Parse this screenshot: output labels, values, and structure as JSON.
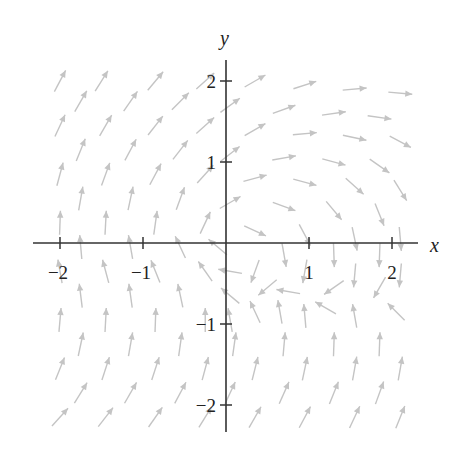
{
  "chart_data": {
    "type": "vector_field",
    "title": "",
    "xlabel": "x",
    "ylabel": "y",
    "xlim": [
      -2.2,
      2.2
    ],
    "ylim": [
      -2.3,
      2.3
    ],
    "xticks": [
      -2,
      -1,
      1,
      2
    ],
    "yticks": [
      -2,
      -1,
      1,
      2
    ],
    "xtick_labels": [
      "−2",
      "−1",
      "1",
      "2"
    ],
    "ytick_labels": [
      "−2",
      "−1",
      "1",
      "2"
    ],
    "grid": false,
    "arrow_color": "#c4c4c4",
    "axis_color": "#333333",
    "arrows": [
      {
        "x": -2.0,
        "y": 2.0,
        "angle": 62
      },
      {
        "x": -1.5,
        "y": 2.0,
        "angle": 58
      },
      {
        "x": -0.85,
        "y": 2.0,
        "angle": 50
      },
      {
        "x": -0.25,
        "y": 2.0,
        "angle": 42
      },
      {
        "x": 0.35,
        "y": 2.0,
        "angle": 30
      },
      {
        "x": 0.95,
        "y": 1.95,
        "angle": 18
      },
      {
        "x": 1.55,
        "y": 1.9,
        "angle": 5
      },
      {
        "x": 2.1,
        "y": 1.85,
        "angle": -5
      },
      {
        "x": -1.75,
        "y": 1.75,
        "angle": 60
      },
      {
        "x": -1.15,
        "y": 1.75,
        "angle": 55
      },
      {
        "x": -0.55,
        "y": 1.75,
        "angle": 45
      },
      {
        "x": 0.05,
        "y": 1.7,
        "angle": 36
      },
      {
        "x": 0.7,
        "y": 1.65,
        "angle": 20
      },
      {
        "x": 1.3,
        "y": 1.6,
        "angle": 8
      },
      {
        "x": 1.85,
        "y": 1.55,
        "angle": -8
      },
      {
        "x": -2.0,
        "y": 1.45,
        "angle": 65
      },
      {
        "x": -1.45,
        "y": 1.45,
        "angle": 60
      },
      {
        "x": -0.85,
        "y": 1.45,
        "angle": 52
      },
      {
        "x": -0.25,
        "y": 1.45,
        "angle": 42
      },
      {
        "x": 0.35,
        "y": 1.4,
        "angle": 30
      },
      {
        "x": 0.95,
        "y": 1.35,
        "angle": 5
      },
      {
        "x": 1.55,
        "y": 1.3,
        "angle": -12
      },
      {
        "x": 2.1,
        "y": 1.25,
        "angle": -28
      },
      {
        "x": -1.75,
        "y": 1.15,
        "angle": 68
      },
      {
        "x": -1.15,
        "y": 1.15,
        "angle": 62
      },
      {
        "x": -0.55,
        "y": 1.15,
        "angle": 52
      },
      {
        "x": 0.05,
        "y": 1.1,
        "angle": 38
      },
      {
        "x": 0.7,
        "y": 1.05,
        "angle": 10
      },
      {
        "x": 1.3,
        "y": 1.0,
        "angle": -15
      },
      {
        "x": 1.85,
        "y": 0.95,
        "angle": -35
      },
      {
        "x": -2.0,
        "y": 0.85,
        "angle": 75
      },
      {
        "x": -1.45,
        "y": 0.85,
        "angle": 70
      },
      {
        "x": -0.85,
        "y": 0.85,
        "angle": 62
      },
      {
        "x": -0.25,
        "y": 0.85,
        "angle": 48
      },
      {
        "x": 0.35,
        "y": 0.8,
        "angle": 15
      },
      {
        "x": 0.95,
        "y": 0.75,
        "angle": -15
      },
      {
        "x": 1.55,
        "y": 0.7,
        "angle": -42
      },
      {
        "x": 2.1,
        "y": 0.65,
        "angle": -58
      },
      {
        "x": -1.75,
        "y": 0.55,
        "angle": 80
      },
      {
        "x": -1.15,
        "y": 0.55,
        "angle": 78
      },
      {
        "x": -0.55,
        "y": 0.55,
        "angle": 70
      },
      {
        "x": 0.05,
        "y": 0.5,
        "angle": 30
      },
      {
        "x": 0.7,
        "y": 0.45,
        "angle": -20
      },
      {
        "x": 1.3,
        "y": 0.4,
        "angle": -50
      },
      {
        "x": 1.85,
        "y": 0.35,
        "angle": -68
      },
      {
        "x": -2.0,
        "y": 0.25,
        "angle": 88
      },
      {
        "x": -1.45,
        "y": 0.25,
        "angle": 87
      },
      {
        "x": -0.85,
        "y": 0.25,
        "angle": 82
      },
      {
        "x": -0.25,
        "y": 0.25,
        "angle": 65
      },
      {
        "x": 0.35,
        "y": 0.15,
        "angle": -25
      },
      {
        "x": 0.95,
        "y": 0.1,
        "angle": -62
      },
      {
        "x": 1.55,
        "y": 0.05,
        "angle": -78
      },
      {
        "x": 2.1,
        "y": 0.05,
        "angle": -85
      },
      {
        "x": -1.75,
        "y": -0.05,
        "angle": 95
      },
      {
        "x": -1.15,
        "y": -0.05,
        "angle": 100
      },
      {
        "x": -0.55,
        "y": -0.05,
        "angle": 115
      },
      {
        "x": -0.1,
        "y": -0.05,
        "angle": 140
      },
      {
        "x": 0.7,
        "y": -0.15,
        "angle": -80
      },
      {
        "x": 1.3,
        "y": -0.15,
        "angle": -88
      },
      {
        "x": 1.85,
        "y": -0.15,
        "angle": -92
      },
      {
        "x": -2.0,
        "y": -0.35,
        "angle": 100
      },
      {
        "x": -1.45,
        "y": -0.35,
        "angle": 105
      },
      {
        "x": -0.85,
        "y": -0.35,
        "angle": 112
      },
      {
        "x": -0.25,
        "y": -0.35,
        "angle": 125
      },
      {
        "x": 0.05,
        "y": -0.35,
        "angle": 170
      },
      {
        "x": 0.35,
        "y": -0.35,
        "angle": -110
      },
      {
        "x": 0.95,
        "y": -0.35,
        "angle": -100
      },
      {
        "x": 1.55,
        "y": -0.4,
        "angle": -95
      },
      {
        "x": 2.1,
        "y": -0.4,
        "angle": -95
      },
      {
        "x": -1.75,
        "y": -0.65,
        "angle": 97
      },
      {
        "x": -1.15,
        "y": -0.65,
        "angle": 98
      },
      {
        "x": -0.55,
        "y": -0.65,
        "angle": 102
      },
      {
        "x": 0.05,
        "y": -0.65,
        "angle": 140
      },
      {
        "x": 0.5,
        "y": -0.55,
        "angle": -140
      },
      {
        "x": 0.75,
        "y": -0.6,
        "angle": 170
      },
      {
        "x": 1.3,
        "y": -0.55,
        "angle": -145
      },
      {
        "x": 1.85,
        "y": -0.55,
        "angle": -120
      },
      {
        "x": -2.0,
        "y": -0.95,
        "angle": 85
      },
      {
        "x": -1.45,
        "y": -0.95,
        "angle": 87
      },
      {
        "x": -0.85,
        "y": -0.95,
        "angle": 88
      },
      {
        "x": -0.25,
        "y": -0.95,
        "angle": 90
      },
      {
        "x": 0.05,
        "y": -0.95,
        "angle": 100
      },
      {
        "x": 0.35,
        "y": -0.85,
        "angle": 115
      },
      {
        "x": 0.65,
        "y": -0.85,
        "angle": 100
      },
      {
        "x": 0.95,
        "y": -0.9,
        "angle": 95
      },
      {
        "x": 1.2,
        "y": -0.8,
        "angle": 150
      },
      {
        "x": 1.55,
        "y": -0.9,
        "angle": 100
      },
      {
        "x": 2.05,
        "y": -0.85,
        "angle": 135
      },
      {
        "x": -1.75,
        "y": -1.25,
        "angle": 78
      },
      {
        "x": -1.15,
        "y": -1.25,
        "angle": 80
      },
      {
        "x": -0.55,
        "y": -1.25,
        "angle": 82
      },
      {
        "x": 0.1,
        "y": -1.25,
        "angle": 82
      },
      {
        "x": 0.7,
        "y": -1.25,
        "angle": 85
      },
      {
        "x": 1.3,
        "y": -1.25,
        "angle": 88
      },
      {
        "x": 1.85,
        "y": -1.25,
        "angle": 88
      },
      {
        "x": -2.0,
        "y": -1.55,
        "angle": 68
      },
      {
        "x": -1.45,
        "y": -1.55,
        "angle": 72
      },
      {
        "x": -0.85,
        "y": -1.55,
        "angle": 72
      },
      {
        "x": -0.25,
        "y": -1.55,
        "angle": 75
      },
      {
        "x": 0.35,
        "y": -1.55,
        "angle": 76
      },
      {
        "x": 0.95,
        "y": -1.55,
        "angle": 78
      },
      {
        "x": 1.55,
        "y": -1.55,
        "angle": 80
      },
      {
        "x": 2.1,
        "y": -1.55,
        "angle": 80
      },
      {
        "x": -1.75,
        "y": -1.85,
        "angle": 58
      },
      {
        "x": -1.15,
        "y": -1.85,
        "angle": 60
      },
      {
        "x": -0.55,
        "y": -1.85,
        "angle": 62
      },
      {
        "x": 0.05,
        "y": -1.85,
        "angle": 65
      },
      {
        "x": 0.7,
        "y": -1.85,
        "angle": 66
      },
      {
        "x": 1.3,
        "y": -1.85,
        "angle": 68
      },
      {
        "x": 1.85,
        "y": -1.85,
        "angle": 70
      },
      {
        "x": -2.0,
        "y": -2.15,
        "angle": 48
      },
      {
        "x": -1.45,
        "y": -2.15,
        "angle": 52
      },
      {
        "x": -0.85,
        "y": -2.15,
        "angle": 55
      },
      {
        "x": -0.25,
        "y": -2.15,
        "angle": 58
      },
      {
        "x": 0.35,
        "y": -2.15,
        "angle": 60
      },
      {
        "x": 0.95,
        "y": -2.15,
        "angle": 62
      },
      {
        "x": 1.55,
        "y": -2.15,
        "angle": 65
      },
      {
        "x": 2.1,
        "y": -2.15,
        "angle": 68
      }
    ]
  }
}
